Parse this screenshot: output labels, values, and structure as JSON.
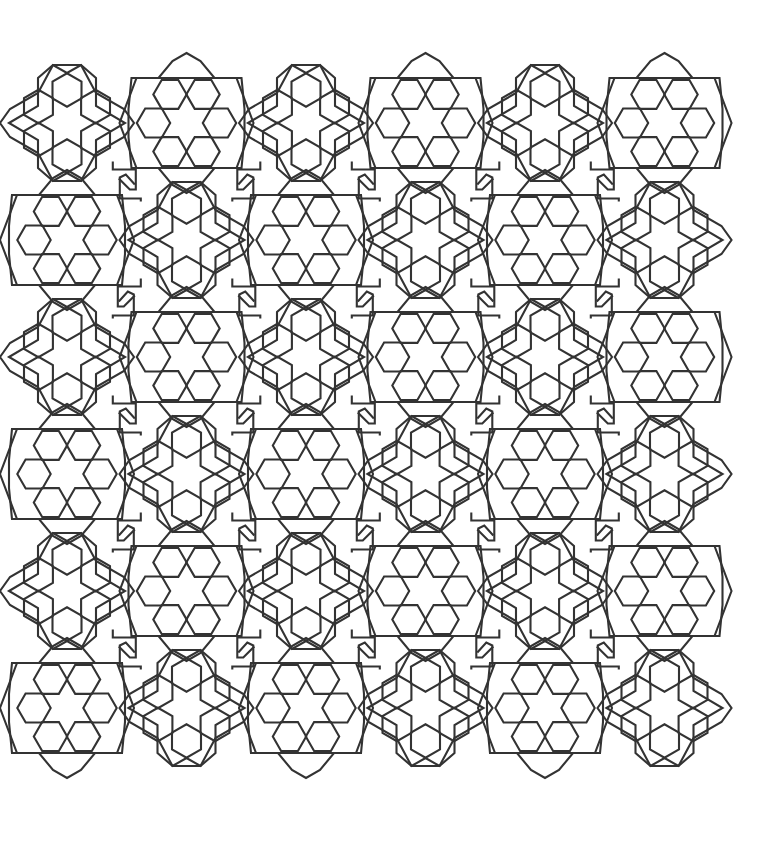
{
  "image": {
    "description": "Geometric interlocking tessellation line-art of hexagonal rosettes",
    "background": "#ffffff",
    "line_color": "#333333",
    "line_width": 2.1
  },
  "pattern": {
    "rows": 6,
    "cols": 6,
    "origin_x": 67,
    "origin_y": 123,
    "col_spacing": 119.5,
    "row_spacing": 117,
    "hex_radius": 16.7,
    "ring_radius": 33,
    "first_motif_type": "A",
    "motif_types": {
      "A": {
        "name": "pointy-top-hex-rosette",
        "hex_orientation": "pointy",
        "ring_start_angle": 30,
        "frame_axis": "horizontal"
      },
      "B": {
        "name": "flat-top-hex-rosette",
        "hex_orientation": "flat",
        "ring_start_angle": 0,
        "frame_axis": "vertical"
      }
    },
    "connector": {
      "name": "interlocking-hook-connector"
    }
  }
}
